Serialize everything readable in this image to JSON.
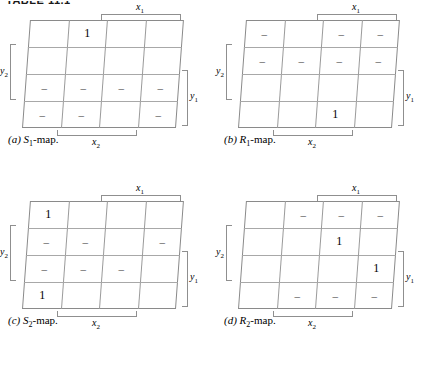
{
  "running_head": "TABLE 11.1",
  "figure": {
    "axis_labels": {
      "x1": "x",
      "x1_sub": "1",
      "x2": "x",
      "x2_sub": "2",
      "y1": "y",
      "y1_sub": "1",
      "y2": "y",
      "y2_sub": "2"
    },
    "symbols": {
      "one": "1",
      "dash": "–",
      "blank": ""
    }
  },
  "panels": [
    {
      "key": "a",
      "caption_tag": "(a)",
      "caption_name": "S",
      "caption_sub": "1",
      "caption_suffix": "-map.",
      "cells": [
        [
          "",
          "1",
          "",
          ""
        ],
        [
          "",
          "",
          "",
          ""
        ],
        [
          "–",
          "–",
          "–",
          "–"
        ],
        [
          "–",
          "–",
          "",
          "–"
        ]
      ]
    },
    {
      "key": "b",
      "caption_tag": "(b)",
      "caption_name": "R",
      "caption_sub": "1",
      "caption_suffix": "-map.",
      "cells": [
        [
          "–",
          "",
          "–",
          "–"
        ],
        [
          "–",
          "–",
          "–",
          "–"
        ],
        [
          "",
          "",
          "",
          ""
        ],
        [
          "",
          "",
          "1",
          ""
        ]
      ]
    },
    {
      "key": "c",
      "caption_tag": "(c)",
      "caption_name": "S",
      "caption_sub": "2",
      "caption_suffix": "-map.",
      "cells": [
        [
          "1",
          "",
          "",
          ""
        ],
        [
          "–",
          "–",
          "",
          "–"
        ],
        [
          "–",
          "–",
          "–",
          ""
        ],
        [
          "1",
          "",
          "",
          ""
        ]
      ]
    },
    {
      "key": "d",
      "caption_tag": "(d)",
      "caption_name": "R",
      "caption_sub": "2",
      "caption_suffix": "-map.",
      "cells": [
        [
          "",
          "–",
          "–",
          "–"
        ],
        [
          "",
          "",
          "1",
          ""
        ],
        [
          "",
          "",
          "",
          "1"
        ],
        [
          "",
          "–",
          "–",
          "–"
        ]
      ]
    }
  ]
}
